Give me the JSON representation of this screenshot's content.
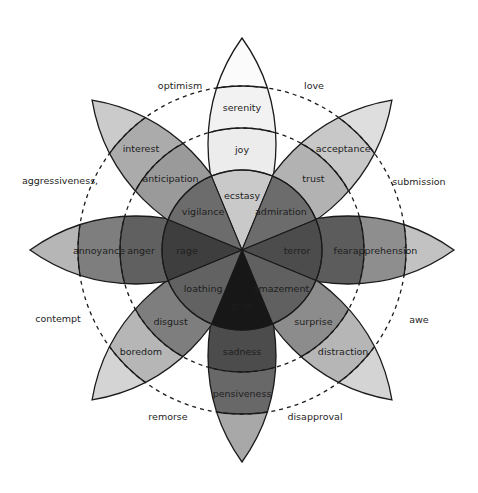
{
  "geometry": {
    "cx": 242,
    "cy": 250,
    "r_inner": 80,
    "r_mid": 122,
    "r_outer": 164,
    "r_tip": 212,
    "petal_half_width": 34,
    "dashed_radius_inner": 122,
    "dashed_radius_outer": 164
  },
  "petals": [
    {
      "angle": -90,
      "primary": "joy",
      "intense": "ecstasy",
      "mild": "serenity",
      "colors": {
        "inner": "#c9c9c9",
        "mid": "#ececec",
        "outer": "#f2f2f2",
        "tip": "#fbfbfb"
      }
    },
    {
      "angle": -45,
      "primary": "trust",
      "intense": "admiration",
      "mild": "acceptance",
      "colors": {
        "inner": "#6c6c6c",
        "mid": "#b2b2b2",
        "outer": "#c8c8c8",
        "tip": "#dedede"
      }
    },
    {
      "angle": 0,
      "primary": "fear",
      "intense": "terror",
      "mild": "apprehension",
      "colors": {
        "inner": "#4c4c4c",
        "mid": "#5c5c5c",
        "outer": "#8e8e8e",
        "tip": "#c2c2c2"
      }
    },
    {
      "angle": 45,
      "primary": "surprise",
      "intense": "amazement",
      "mild": "distraction",
      "colors": {
        "inner": "#606060",
        "mid": "#8c8c8c",
        "outer": "#b6b6b6",
        "tip": "#d4d4d4"
      }
    },
    {
      "angle": 90,
      "primary": "sadness",
      "intense": "grief",
      "mild": "pensiveness",
      "colors": {
        "inner": "#171717",
        "mid": "#4c4c4c",
        "outer": "#686868",
        "tip": "#a8a8a8"
      }
    },
    {
      "angle": 135,
      "primary": "disgust",
      "intense": "loathing",
      "mild": "boredom",
      "colors": {
        "inner": "#626262",
        "mid": "#7e7e7e",
        "outer": "#b6b6b6",
        "tip": "#d4d4d4"
      }
    },
    {
      "angle": 180,
      "primary": "anger",
      "intense": "rage",
      "mild": "annoyance",
      "colors": {
        "inner": "#3e3e3e",
        "mid": "#606060",
        "outer": "#7e7e7e",
        "tip": "#b6b6b6"
      }
    },
    {
      "angle": -135,
      "primary": "anticipation",
      "intense": "vigilance",
      "mild": "interest",
      "colors": {
        "inner": "#6c6c6c",
        "mid": "#9a9a9a",
        "outer": "#ababab",
        "tip": "#cbcbcb"
      }
    }
  ],
  "dyads": [
    {
      "label": "love",
      "x": 314,
      "y": 85
    },
    {
      "label": "submission",
      "x": 419,
      "y": 181
    },
    {
      "label": "awe",
      "x": 419,
      "y": 319
    },
    {
      "label": "disapproval",
      "x": 315,
      "y": 416
    },
    {
      "label": "remorse",
      "x": 168,
      "y": 416
    },
    {
      "label": "contempt",
      "x": 58,
      "y": 318
    },
    {
      "label": "aggressiveness,",
      "x": 60,
      "y": 180
    },
    {
      "label": "optimism",
      "x": 180,
      "y": 85
    }
  ]
}
